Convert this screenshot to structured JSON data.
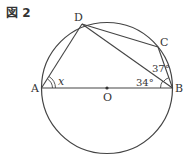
{
  "figure": {
    "title": "図 2",
    "points": {
      "A": "A",
      "B": "B",
      "C": "C",
      "D": "D",
      "O": "O"
    },
    "angles": {
      "angle_DAB": "x",
      "angle_DBA": "34°",
      "angle_DBC": "37°"
    }
  }
}
